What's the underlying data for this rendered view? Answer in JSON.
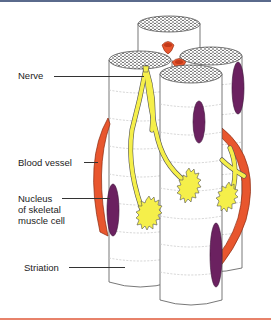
{
  "figure": {
    "labels": {
      "nerve": "Nerve",
      "blood_vessel": "Blood vessel",
      "nucleus_line1": "Nucleus",
      "nucleus_line2": "of skeletal",
      "nucleus_line3": "muscle cell",
      "striation": "Striation"
    },
    "colors": {
      "top_rule": "#5a6a8c",
      "bottom_rule": "#e8826a",
      "blood_vessel": "#e8562e",
      "nucleus": "#6b2160",
      "nerve": "#f5ef4a",
      "fiber_outline": "#555555",
      "striation": "#c8c8c8"
    }
  }
}
